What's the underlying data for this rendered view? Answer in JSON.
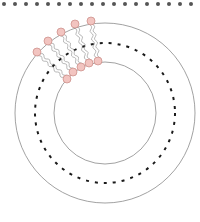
{
  "diagram": {
    "type": "liposome-cross-section",
    "colors": {
      "background": "#ffffff",
      "membrane_line": "#8a8a8a",
      "dashed_line": "#1a1a1a",
      "top_dots": "#555555",
      "head_fill": "#f2c4c0",
      "head_stroke": "#c98a84",
      "tail_stroke": "#8a8a8a"
    },
    "top_dots": {
      "y": 4,
      "start_x": 4,
      "spacing": 11,
      "count": 18,
      "radius": 2
    },
    "vesicle": {
      "center": [
        105,
        113
      ],
      "outer_radius": 90,
      "inner_radius": 51,
      "midplane_radius": 70
    },
    "lipids": {
      "outer_heads": [
        [
          37,
          52
        ],
        [
          48,
          41
        ],
        [
          61,
          32
        ],
        [
          75,
          24
        ],
        [
          91,
          21
        ]
      ],
      "inner_heads": [
        [
          67,
          79
        ],
        [
          73,
          72
        ],
        [
          81,
          67
        ],
        [
          89,
          63
        ],
        [
          98,
          61
        ]
      ],
      "head_radius": 4
    }
  }
}
